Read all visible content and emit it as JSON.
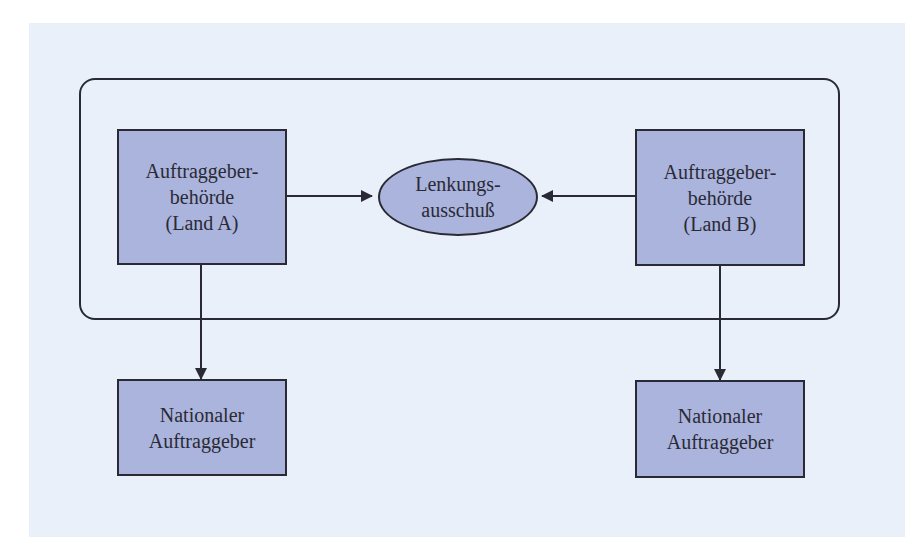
{
  "diagram": {
    "type": "organization-flow",
    "colors": {
      "background_panel": "#e9f0fa",
      "node_fill": "#aab4dd",
      "stroke": "#2a2a35"
    },
    "group": {
      "label": "",
      "contains": [
        "authority_a",
        "steering_committee",
        "authority_b"
      ]
    },
    "nodes": {
      "authority_a": {
        "shape": "rectangle",
        "lines": [
          "Auftraggeber-",
          "behörde",
          "(Land A)"
        ]
      },
      "steering_committee": {
        "shape": "ellipse",
        "lines": [
          "Lenkungs-",
          "ausschuß"
        ]
      },
      "authority_b": {
        "shape": "rectangle",
        "lines": [
          "Auftraggeber-",
          "behörde",
          "(Land B)"
        ]
      },
      "national_client_a": {
        "shape": "rectangle",
        "lines": [
          "Nationaler",
          "Auftraggeber"
        ]
      },
      "national_client_b": {
        "shape": "rectangle",
        "lines": [
          "Nationaler",
          "Auftraggeber"
        ]
      }
    },
    "edges": [
      {
        "from": "authority_a",
        "to": "steering_committee",
        "arrow": "end"
      },
      {
        "from": "authority_b",
        "to": "steering_committee",
        "arrow": "end"
      },
      {
        "from": "authority_a",
        "to": "national_client_a",
        "arrow": "end"
      },
      {
        "from": "authority_b",
        "to": "national_client_b",
        "arrow": "end"
      }
    ]
  }
}
